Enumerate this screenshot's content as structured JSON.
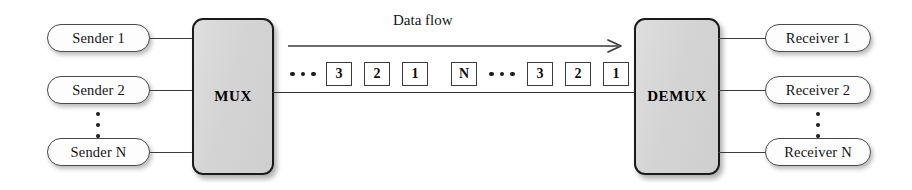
{
  "diagram": {
    "flow_label": "Data flow",
    "colors": {
      "block_fill": "#d6d6d6",
      "block_border": "#1a1a1a",
      "pill_fill": "#fdfdfd",
      "pill_border": "#4a4a4a",
      "line": "#3c3c3c",
      "background": "#ffffff"
    }
  },
  "senders": [
    {
      "label": "Sender 1"
    },
    {
      "label": "Sender 2"
    },
    {
      "label": "Sender N"
    }
  ],
  "sender_ellipsis": "vertical-ellipsis",
  "mux": {
    "label": "MUX"
  },
  "demux": {
    "label": "DEMUX"
  },
  "receivers": [
    {
      "label": "Receiver 1"
    },
    {
      "label": "Receiver 2"
    },
    {
      "label": "Receiver N"
    }
  ],
  "receiver_ellipsis": "vertical-ellipsis",
  "data_stream": {
    "items": [
      {
        "type": "ellipsis",
        "value": "···"
      },
      {
        "type": "cell",
        "value": "3"
      },
      {
        "type": "cell",
        "value": "2"
      },
      {
        "type": "cell",
        "value": "1"
      },
      {
        "type": "cell",
        "value": "N"
      },
      {
        "type": "ellipsis",
        "value": "···"
      },
      {
        "type": "cell",
        "value": "3"
      },
      {
        "type": "cell",
        "value": "2"
      },
      {
        "type": "cell",
        "value": "1"
      }
    ]
  },
  "arrow": {
    "direction": "right",
    "name": "data-flow-arrow"
  }
}
